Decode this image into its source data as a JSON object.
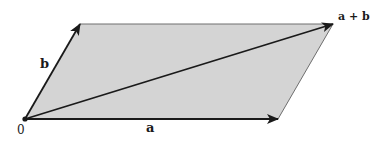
{
  "diagram": {
    "colors": {
      "fill": "#d4d4d4",
      "stroke": "#1a1a1a",
      "edge": "#6e6e6e"
    },
    "points": {
      "origin": {
        "x": 25,
        "y": 119
      },
      "b_tip": {
        "x": 80,
        "y": 24
      },
      "a_tip": {
        "x": 278,
        "y": 119
      },
      "sum_tip": {
        "x": 333,
        "y": 24
      }
    },
    "labels": {
      "origin": "0",
      "a": "a",
      "b": "b",
      "sum": "a + b"
    }
  }
}
